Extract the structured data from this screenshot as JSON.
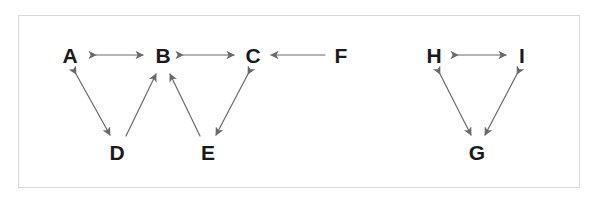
{
  "diagram": {
    "background_color": "#ffffff",
    "border_color": "#d8d8d8",
    "edge_color": "#6a6a6a",
    "label_color": "#1a1a1a",
    "nodes": [
      {
        "id": "A",
        "label": "A",
        "x": 70,
        "y": 55
      },
      {
        "id": "B",
        "label": "B",
        "x": 163,
        "y": 55
      },
      {
        "id": "C",
        "label": "C",
        "x": 253,
        "y": 55
      },
      {
        "id": "F",
        "label": "F",
        "x": 341,
        "y": 55
      },
      {
        "id": "D",
        "label": "D",
        "x": 117,
        "y": 152
      },
      {
        "id": "E",
        "label": "E",
        "x": 208,
        "y": 152
      },
      {
        "id": "H",
        "label": "H",
        "x": 434,
        "y": 55
      },
      {
        "id": "I",
        "label": "I",
        "x": 522,
        "y": 55
      },
      {
        "id": "G",
        "label": "G",
        "x": 477,
        "y": 152
      }
    ],
    "edges": [
      {
        "id": "edge-a-b",
        "from": "A",
        "to": "B",
        "direction": "both",
        "x1": 96,
        "y1": 55,
        "x2": 143,
        "y2": 55
      },
      {
        "id": "edge-b-c",
        "from": "B",
        "to": "C",
        "direction": "both",
        "x1": 183,
        "y1": 55,
        "x2": 234,
        "y2": 55
      },
      {
        "id": "edge-f-c",
        "from": "F",
        "to": "C",
        "direction": "forward",
        "x1": 325,
        "y1": 55,
        "x2": 271,
        "y2": 55
      },
      {
        "id": "edge-a-d",
        "from": "A",
        "to": "D",
        "direction": "both",
        "x1": 76,
        "y1": 74,
        "x2": 110,
        "y2": 135
      },
      {
        "id": "edge-d-b",
        "from": "D",
        "to": "B",
        "direction": "forward",
        "x1": 126,
        "y1": 136,
        "x2": 156,
        "y2": 74
      },
      {
        "id": "edge-e-b",
        "from": "E",
        "to": "B",
        "direction": "forward",
        "x1": 200,
        "y1": 136,
        "x2": 170,
        "y2": 74
      },
      {
        "id": "edge-c-e",
        "from": "C",
        "to": "E",
        "direction": "both",
        "x1": 248,
        "y1": 74,
        "x2": 216,
        "y2": 135
      },
      {
        "id": "edge-h-i",
        "from": "H",
        "to": "I",
        "direction": "both",
        "x1": 458,
        "y1": 55,
        "x2": 506,
        "y2": 55
      },
      {
        "id": "edge-h-g",
        "from": "H",
        "to": "G",
        "direction": "both",
        "x1": 440,
        "y1": 74,
        "x2": 471,
        "y2": 135
      },
      {
        "id": "edge-i-g",
        "from": "I",
        "to": "G",
        "direction": "both",
        "x1": 517,
        "y1": 74,
        "x2": 485,
        "y2": 135
      }
    ]
  }
}
